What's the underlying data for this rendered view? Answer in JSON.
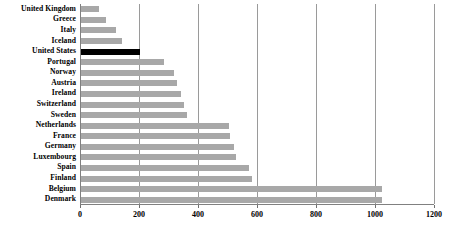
{
  "chart_data": {
    "type": "bar",
    "orientation": "horizontal",
    "title": "",
    "xlabel": "",
    "ylabel": "",
    "xlim": [
      0,
      1200
    ],
    "xticks": [
      0,
      200,
      400,
      600,
      800,
      1000,
      1200
    ],
    "xtick_labels": [
      "0",
      "200",
      "400",
      "600",
      "800",
      "1000",
      "1200"
    ],
    "grid": true,
    "grid_axis": "x",
    "legend": false,
    "categories": [
      "United Kingdom",
      "Greece",
      "Italy",
      "Iceland",
      "United States",
      "Portugal",
      "Norway",
      "Austria",
      "Ireland",
      "Switzerland",
      "Sweden",
      "Netherlands",
      "France",
      "Germany",
      "Luxembourg",
      "Spain",
      "Finland",
      "Belgium",
      "Denmark"
    ],
    "values": [
      60,
      85,
      120,
      140,
      200,
      280,
      315,
      325,
      340,
      350,
      360,
      500,
      505,
      520,
      525,
      570,
      580,
      1020,
      1020
    ],
    "bar_color": "#a8a8a8",
    "highlight_color": "#000000",
    "highlighted_categories": [
      "United States"
    ]
  }
}
